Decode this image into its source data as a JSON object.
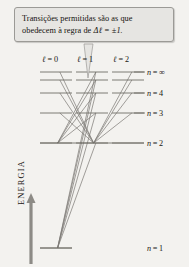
{
  "figure": {
    "background_color": "#f3f2ef",
    "callout": {
      "line1": "Transições permitidas são as que",
      "line2_pre": "obedecem à regra de ",
      "line2_delta": "Δℓ = ±1.",
      "bg_color": "#e6e5e2",
      "border_color": "#9b9a96"
    },
    "axis": {
      "label": "ENERGIA",
      "direction": "up",
      "color": "#8d8b86"
    },
    "columns": [
      {
        "id": "l0",
        "label_l": "ℓ",
        "label_eq": "= 0",
        "label": "ℓ = 0",
        "x_label": 42,
        "x_start": 40,
        "x_end": 72
      },
      {
        "id": "l1",
        "label_l": "ℓ",
        "label_eq": "= 1",
        "label": "ℓ = 1",
        "x_label": 77,
        "x_start": 76,
        "x_end": 108
      },
      {
        "id": "l2",
        "label_l": "ℓ",
        "label_eq": "= 2",
        "label": "ℓ = 2",
        "x_label": 113,
        "x_start": 112,
        "x_end": 144
      }
    ],
    "levels": [
      {
        "n": "∞",
        "label": "n = ∞",
        "y": 72,
        "label_x": 147,
        "label_y": 68
      },
      {
        "n": "5",
        "label": "",
        "y": 80,
        "label_x": 0,
        "label_y": 0
      },
      {
        "n": "4",
        "label": "n = 4",
        "y": 93,
        "label_x": 147,
        "label_y": 89
      },
      {
        "n": "3",
        "label": "n = 3",
        "y": 113,
        "label_x": 147,
        "label_y": 109
      },
      {
        "n": "2",
        "label": "n = 2",
        "y": 143,
        "label_x": 147,
        "label_y": 139
      },
      {
        "n": "1",
        "label": "n = 1",
        "y": 248,
        "label_x": 147,
        "label_y": 244
      }
    ],
    "level_line_color": "#6f6d68",
    "transition_line_color": "#7d7b76",
    "transitions": [
      {
        "from_col": "l1",
        "from_n": "∞",
        "to_col": "l0",
        "to_n": "2"
      },
      {
        "from_col": "l1",
        "from_n": "5",
        "to_col": "l0",
        "to_n": "2"
      },
      {
        "from_col": "l1",
        "from_n": "4",
        "to_col": "l0",
        "to_n": "2"
      },
      {
        "from_col": "l1",
        "from_n": "3",
        "to_col": "l0",
        "to_n": "2"
      },
      {
        "from_col": "l0",
        "from_n": "∞",
        "to_col": "l1",
        "to_n": "2"
      },
      {
        "from_col": "l0",
        "from_n": "5",
        "to_col": "l1",
        "to_n": "2"
      },
      {
        "from_col": "l0",
        "from_n": "4",
        "to_col": "l1",
        "to_n": "2"
      },
      {
        "from_col": "l0",
        "from_n": "3",
        "to_col": "l1",
        "to_n": "2"
      },
      {
        "from_col": "l2",
        "from_n": "∞",
        "to_col": "l1",
        "to_n": "2"
      },
      {
        "from_col": "l2",
        "from_n": "5",
        "to_col": "l1",
        "to_n": "2"
      },
      {
        "from_col": "l2",
        "from_n": "4",
        "to_col": "l1",
        "to_n": "2"
      },
      {
        "from_col": "l2",
        "from_n": "3",
        "to_col": "l1",
        "to_n": "2"
      },
      {
        "from_col": "l1",
        "from_n": "∞",
        "to_col": "l0",
        "to_n": "1"
      },
      {
        "from_col": "l1",
        "from_n": "5",
        "to_col": "l0",
        "to_n": "1"
      },
      {
        "from_col": "l1",
        "from_n": "4",
        "to_col": "l0",
        "to_n": "1"
      },
      {
        "from_col": "l1",
        "from_n": "3",
        "to_col": "l0",
        "to_n": "1"
      },
      {
        "from_col": "l1",
        "from_n": "2",
        "to_col": "l0",
        "to_n": "1"
      }
    ]
  }
}
